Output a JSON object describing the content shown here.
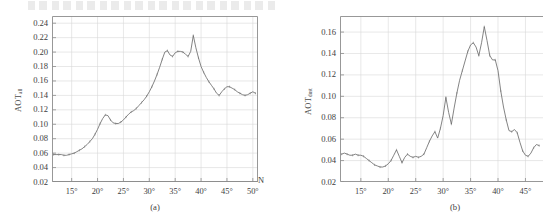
{
  "figure": {
    "panels": [
      {
        "id": "a",
        "caption": "(a)",
        "ylabel_main": "AOT",
        "ylabel_sub": "all",
        "xunit": "N",
        "chart_data": {
          "type": "line",
          "title": "",
          "xlabel": "",
          "ylabel": "AOT_all",
          "xlim": [
            11.2,
            51.0
          ],
          "ylim": [
            0.02,
            0.25
          ],
          "xticks": [
            "15°",
            "20°",
            "25°",
            "30°",
            "35°",
            "40°",
            "45°",
            "50°"
          ],
          "xtick_values": [
            15,
            20,
            25,
            30,
            35,
            40,
            45,
            50
          ],
          "yticks": [
            "0.02",
            "0.04",
            "0.06",
            "0.08",
            "0.10",
            "0.12",
            "0.14",
            "0.16",
            "0.18",
            "0.20",
            "0.22",
            "0.24"
          ],
          "ytick_values": [
            0.02,
            0.04,
            0.06,
            0.08,
            0.1,
            0.12,
            0.14,
            0.16,
            0.18,
            0.2,
            0.22,
            0.24
          ],
          "grid": true,
          "legend": "none",
          "series": [
            {
              "name": "AOT_all",
              "x": [
                11.5,
                12.0,
                12.5,
                13.0,
                13.5,
                14.0,
                14.5,
                15.0,
                15.5,
                16.0,
                16.5,
                17.0,
                17.5,
                18.0,
                18.5,
                19.0,
                19.5,
                20.0,
                20.5,
                21.0,
                21.5,
                22.0,
                22.5,
                23.0,
                23.5,
                24.0,
                24.5,
                25.0,
                25.5,
                26.0,
                26.5,
                27.0,
                27.5,
                28.0,
                28.5,
                29.0,
                29.5,
                30.0,
                30.5,
                31.0,
                31.5,
                32.0,
                32.5,
                33.0,
                33.5,
                34.0,
                34.5,
                35.0,
                35.5,
                36.0,
                36.5,
                37.0,
                37.5,
                38.0,
                38.5,
                39.0,
                39.5,
                40.0,
                40.5,
                41.0,
                41.5,
                42.0,
                42.5,
                43.0,
                43.5,
                44.0,
                44.5,
                45.0,
                45.5,
                46.0,
                46.5,
                47.0,
                47.5,
                48.0,
                48.5,
                49.0,
                49.5,
                50.0,
                50.5
              ],
              "values": [
                0.058,
                0.058,
                0.058,
                0.058,
                0.057,
                0.057,
                0.058,
                0.059,
                0.06,
                0.062,
                0.064,
                0.066,
                0.069,
                0.072,
                0.076,
                0.08,
                0.086,
                0.093,
                0.101,
                0.108,
                0.113,
                0.112,
                0.106,
                0.102,
                0.101,
                0.101,
                0.103,
                0.106,
                0.11,
                0.114,
                0.117,
                0.119,
                0.122,
                0.126,
                0.13,
                0.134,
                0.139,
                0.145,
                0.152,
                0.16,
                0.169,
                0.179,
                0.19,
                0.2,
                0.202,
                0.196,
                0.194,
                0.199,
                0.201,
                0.201,
                0.2,
                0.197,
                0.194,
                0.201,
                0.223,
                0.206,
                0.192,
                0.18,
                0.172,
                0.165,
                0.159,
                0.154,
                0.149,
                0.143,
                0.14,
                0.145,
                0.149,
                0.152,
                0.152,
                0.15,
                0.148,
                0.145,
                0.143,
                0.141,
                0.14,
                0.141,
                0.143,
                0.145,
                0.143
              ]
            }
          ]
        }
      },
      {
        "id": "b",
        "caption": "(b)",
        "ylabel_main": "AOT",
        "ylabel_sub": "dust",
        "xunit": "",
        "chart_data": {
          "type": "line",
          "title": "",
          "xlabel": "",
          "ylabel": "AOT_dust",
          "xlim": [
            11.2,
            48.2
          ],
          "ylim": [
            0.02,
            0.175
          ],
          "xticks": [
            "15°",
            "20°",
            "25°",
            "30°",
            "35°",
            "40°",
            "45°"
          ],
          "xtick_values": [
            15,
            20,
            25,
            30,
            35,
            40,
            45
          ],
          "yticks": [
            "0.02",
            "0.04",
            "0.06",
            "0.08",
            "0.10",
            "0.12",
            "0.14",
            "0.16"
          ],
          "ytick_values": [
            0.02,
            0.04,
            0.06,
            0.08,
            0.1,
            0.12,
            0.14,
            0.16
          ],
          "grid": true,
          "legend": "none",
          "series": [
            {
              "name": "AOT_dust",
              "x": [
                11.5,
                12.0,
                12.5,
                13.0,
                13.5,
                14.0,
                14.5,
                15.0,
                15.5,
                16.0,
                16.5,
                17.0,
                17.5,
                18.0,
                18.5,
                19.0,
                19.5,
                20.0,
                20.5,
                21.0,
                21.5,
                22.0,
                22.5,
                23.0,
                23.5,
                24.0,
                24.5,
                25.0,
                25.5,
                26.0,
                26.5,
                27.0,
                27.5,
                28.0,
                28.5,
                29.0,
                29.5,
                30.0,
                30.5,
                31.0,
                31.5,
                32.0,
                32.5,
                33.0,
                33.5,
                34.0,
                34.5,
                35.0,
                35.5,
                36.0,
                36.5,
                37.0,
                37.5,
                38.0,
                38.5,
                39.0,
                39.5,
                40.0,
                40.5,
                41.0,
                41.5,
                42.0,
                42.5,
                43.0,
                43.5,
                44.0,
                44.5,
                45.0,
                45.5,
                46.0,
                46.5,
                47.0,
                47.5
              ],
              "values": [
                0.046,
                0.047,
                0.046,
                0.045,
                0.045,
                0.046,
                0.045,
                0.045,
                0.044,
                0.042,
                0.04,
                0.038,
                0.036,
                0.035,
                0.034,
                0.034,
                0.035,
                0.037,
                0.04,
                0.045,
                0.05,
                0.044,
                0.038,
                0.043,
                0.046,
                0.044,
                0.043,
                0.044,
                0.043,
                0.044,
                0.046,
                0.052,
                0.058,
                0.063,
                0.067,
                0.061,
                0.07,
                0.082,
                0.099,
                0.085,
                0.074,
                0.089,
                0.103,
                0.115,
                0.124,
                0.133,
                0.142,
                0.148,
                0.15,
                0.146,
                0.138,
                0.15,
                0.165,
                0.152,
                0.138,
                0.134,
                0.134,
                0.124,
                0.105,
                0.09,
                0.078,
                0.068,
                0.067,
                0.069,
                0.066,
                0.057,
                0.049,
                0.045,
                0.044,
                0.047,
                0.052,
                0.055,
                0.054
              ]
            }
          ]
        }
      }
    ]
  }
}
